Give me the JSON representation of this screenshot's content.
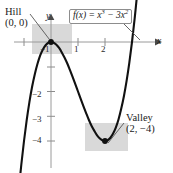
{
  "figure": {
    "background_color": "#ffffff",
    "curve_color": "#111111",
    "axis_color": "#9a9a9a",
    "highlight_color": "#d9d9d9",
    "leader_color": "#555555"
  },
  "axes": {
    "x_name": "x",
    "y_name": "y",
    "x_ticks": [
      {
        "label": "−1",
        "value": -1
      },
      {
        "label": "1",
        "value": 1
      },
      {
        "label": "2",
        "value": 2
      }
    ],
    "y_ticks": [
      {
        "label": "−2",
        "value": -2
      },
      {
        "label": "−3",
        "value": -3
      },
      {
        "label": "−4",
        "value": -4
      }
    ]
  },
  "formula": {
    "lhs": "f(x) = ",
    "term1_base": "x",
    "term1_exp": "3",
    "operator": " − 3",
    "term2_base": "x",
    "term2_exp": "2",
    "full_text": "f(x) = x³ − 3x²"
  },
  "annotations": [
    {
      "id": "hill",
      "name": "Hill",
      "coords": "(0, 0)",
      "point": {
        "x": 0,
        "y": 0
      }
    },
    {
      "id": "valley",
      "name": "Valley",
      "coords": "(2, −4)",
      "point": {
        "x": 2,
        "y": -4
      }
    }
  ],
  "chart_data": {
    "type": "line",
    "title": "",
    "subtitle": "",
    "xlabel": "x",
    "ylabel": "y",
    "xlim": [
      -1.6,
      3.3
    ],
    "ylim": [
      -4.9,
      1.2
    ],
    "grid": false,
    "legend": "none",
    "function_expression": "f(x) = x^3 - 3x^2",
    "series": [
      {
        "name": "f(x) = x³ − 3x²",
        "x": [
          -1.6,
          -1.5,
          -1.4,
          -1.3,
          -1.2,
          -1.1,
          -1.0,
          -0.9,
          -0.8,
          -0.7,
          -0.6,
          -0.5,
          -0.4,
          -0.3,
          -0.2,
          -0.1,
          0.0,
          0.1,
          0.2,
          0.3,
          0.4,
          0.5,
          0.6,
          0.7,
          0.8,
          0.9,
          1.0,
          1.1,
          1.2,
          1.3,
          1.4,
          1.5,
          1.6,
          1.7,
          1.8,
          1.9,
          2.0,
          2.1,
          2.2,
          2.3,
          2.4,
          2.5,
          2.6,
          2.7,
          2.8,
          2.9,
          3.0,
          3.1,
          3.2,
          3.3
        ],
        "y": [
          -11.78,
          -10.13,
          -8.62,
          -7.27,
          -6.05,
          -4.96,
          -4.0,
          -3.16,
          -2.43,
          -1.81,
          -1.3,
          -0.88,
          -0.54,
          -0.3,
          -0.13,
          -0.03,
          0.0,
          -0.03,
          -0.11,
          -0.24,
          -0.42,
          -0.63,
          -0.86,
          -1.13,
          -1.41,
          -1.7,
          -2.0,
          -2.3,
          -2.59,
          -2.87,
          -3.14,
          -3.38,
          -3.58,
          -3.76,
          -3.89,
          -3.97,
          -4.0,
          -3.97,
          -3.87,
          -3.7,
          -3.46,
          -3.13,
          -2.7,
          -2.19,
          -1.57,
          -0.84,
          0.0,
          0.96,
          2.05,
          3.27
        ]
      }
    ],
    "critical_points": [
      {
        "label": "Hill",
        "x": 0,
        "y": 0,
        "type": "local maximum"
      },
      {
        "label": "Valley",
        "x": 2,
        "y": -4,
        "type": "local minimum"
      }
    ]
  }
}
